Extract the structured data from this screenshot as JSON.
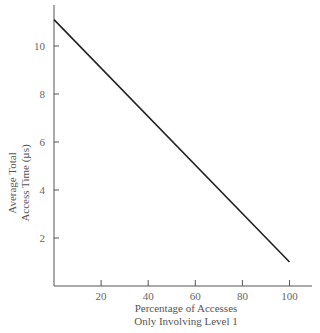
{
  "chart_data": {
    "type": "line",
    "title": "",
    "xlabel": "Percentage of Accesses Only Involving Level 1",
    "xlabel_lines": [
      "Percentage of Accesses",
      "Only Involving Level 1"
    ],
    "ylabel": "Average Total Access Time (µs)",
    "ylabel_lines": [
      "Average Total",
      "Access Time (µs)"
    ],
    "x_ticks": [
      20,
      40,
      60,
      80,
      100
    ],
    "y_ticks": [
      2,
      4,
      6,
      8,
      10
    ],
    "xlim": [
      0,
      110
    ],
    "ylim": [
      0,
      11.7
    ],
    "grid": false,
    "legend": null,
    "series": [
      {
        "name": "Average access time",
        "x": [
          0,
          100
        ],
        "y": [
          11.1,
          1.0
        ],
        "color": "#222222"
      }
    ]
  }
}
